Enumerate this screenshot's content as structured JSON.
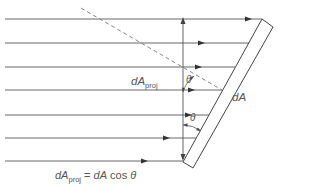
{
  "diagram": {
    "type": "projected-area-illustration",
    "colors": {
      "line": "#555555",
      "dashed": "#777777",
      "text": "#555555",
      "background": "#ffffff"
    },
    "rays": [
      {
        "y": 19,
        "x_start": 5,
        "x_end": 262,
        "arrow_x": 252
      },
      {
        "y": 43,
        "x_start": 5,
        "x_end": 249,
        "arrow_x": 205
      },
      {
        "y": 67,
        "x_start": 5,
        "x_end": 235,
        "arrow_x": 202
      },
      {
        "y": 90,
        "x_start": 5,
        "x_end": 222,
        "arrow_x": 195
      },
      {
        "y": 115,
        "x_start": 5,
        "x_end": 209,
        "arrow_x": 192
      },
      {
        "y": 138,
        "x_start": 5,
        "x_end": 196,
        "arrow_x": 170
      },
      {
        "y": 161,
        "x_start": 5,
        "x_end": 183,
        "arrow_x": 148
      }
    ],
    "labels": {
      "dA_proj_main": "dA",
      "dA_proj_sub": "proj",
      "dA": "dA",
      "theta_upper": "θ",
      "theta_lower": "θ",
      "equation_lhs_main": "dA",
      "equation_lhs_sub": "proj",
      "equation_eq": " = ",
      "equation_rhs_dA": "dA",
      "equation_rhs_cos": " cos ",
      "equation_rhs_theta": "θ"
    }
  }
}
